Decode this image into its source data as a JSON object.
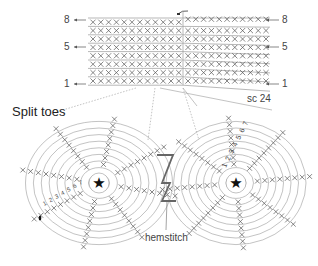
{
  "diagram": {
    "title": "Split toes",
    "stitch_count_label": "sc 24",
    "hemstitch_label": "hemstitch",
    "rows_left": [
      {
        "label": "8",
        "y": 20
      },
      {
        "label": "5",
        "y": 47
      },
      {
        "label": "1",
        "y": 84
      }
    ],
    "rows_right": [
      {
        "label": "8",
        "y": 20
      },
      {
        "label": "5",
        "y": 47
      },
      {
        "label": "1",
        "y": 84
      }
    ],
    "panel": {
      "rows": 8,
      "left_cols": 9,
      "mid_cols": 3,
      "right_cols": 11
    },
    "circles": [
      {
        "name": "left-toe",
        "cx": 99,
        "cy": 183,
        "rings": 9,
        "center_symbol": "★"
      },
      {
        "name": "right-toe",
        "cx": 236,
        "cy": 183,
        "rings": 9,
        "center_symbol": "★"
      }
    ],
    "round_numbers_right": [
      "1",
      "2",
      "3",
      "4",
      "5",
      "6",
      "7"
    ],
    "round_numbers_left": [
      "1",
      "2",
      "3",
      "4",
      "5",
      "6",
      "7"
    ],
    "colors": {
      "line": "#9a9a9a",
      "stitch": "#555555",
      "accent": "#333333",
      "text": "#444444"
    }
  }
}
